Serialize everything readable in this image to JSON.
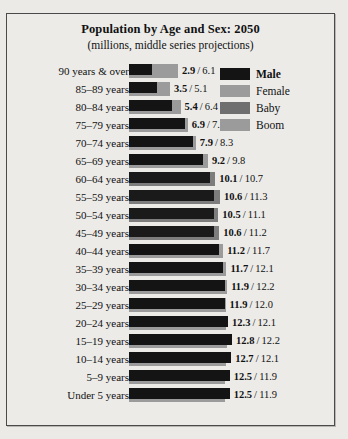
{
  "chart_data": {
    "type": "bar",
    "title": "Population by Age and Sex: 2050",
    "subtitle": "(millions, middle series projections)",
    "xlabel": "",
    "ylabel": "",
    "grid": false,
    "legend_position": "right",
    "xmax": 13.6,
    "categories": [
      "90 years & over",
      "85–89 years",
      "80–84 years",
      "75–79 years",
      "70–74 years",
      "65–69 years",
      "60–64 years",
      "55–59 years",
      "50–54 years",
      "45–49 years",
      "40–44 years",
      "35–39 years",
      "30–34 years",
      "25–29 years",
      "20–24 years",
      "15–19 years",
      "10–14 years",
      "5–9 years",
      "Under 5 years"
    ],
    "series": [
      {
        "name": "Male",
        "color": "#141414",
        "values": [
          2.9,
          3.5,
          5.4,
          6.9,
          7.9,
          9.2,
          10.1,
          10.6,
          10.5,
          10.6,
          11.2,
          11.7,
          11.9,
          11.9,
          12.3,
          12.8,
          12.7,
          12.5,
          12.5
        ]
      },
      {
        "name": "Female",
        "color": "#9b9b9b",
        "values": [
          6.1,
          5.1,
          6.4,
          7.3,
          8.3,
          9.8,
          10.7,
          11.3,
          11.1,
          11.2,
          11.7,
          12.1,
          12.2,
          12.0,
          12.1,
          12.2,
          12.1,
          11.9,
          11.9
        ]
      }
    ],
    "baby_boom_categories": [
      "60–64 years",
      "55–59 years",
      "50–54 years",
      "45–49 years"
    ],
    "value_labels": [
      {
        "male": "2.9",
        "sep": "/",
        "female": "6.1"
      },
      {
        "male": "3.5",
        "sep": "/",
        "female": "5.1"
      },
      {
        "male": "5.4",
        "sep": "/",
        "female": "6.4"
      },
      {
        "male": "6.9",
        "sep": "/",
        "female": "7.3"
      },
      {
        "male": "7.9",
        "sep": "/",
        "female": "8.3"
      },
      {
        "male": "9.2",
        "sep": "/",
        "female": "9.8"
      },
      {
        "male": "10.1",
        "sep": "/",
        "female": "10.7"
      },
      {
        "male": "10.6",
        "sep": "/",
        "female": "11.3"
      },
      {
        "male": "10.5",
        "sep": "/",
        "female": "11.1"
      },
      {
        "male": "10.6",
        "sep": "/",
        "female": "11.2"
      },
      {
        "male": "11.2",
        "sep": "/",
        "female": "11.7"
      },
      {
        "male": "11.7",
        "sep": "/",
        "female": "12.1"
      },
      {
        "male": "11.9",
        "sep": "/",
        "female": "12.2"
      },
      {
        "male": "11.9",
        "sep": "/",
        "female": "12.0"
      },
      {
        "male": "12.3",
        "sep": "/",
        "female": "12.1"
      },
      {
        "male": "12.8",
        "sep": "/",
        "female": "12.2"
      },
      {
        "male": "12.7",
        "sep": "/",
        "female": "12.1"
      },
      {
        "male": "12.5",
        "sep": "/",
        "female": "11.9"
      },
      {
        "male": "12.5",
        "sep": "/",
        "female": "11.9"
      }
    ]
  },
  "legend": {
    "items": [
      {
        "label": "Male",
        "swatch": "male-swatch",
        "bold": true
      },
      {
        "label": "Female",
        "swatch": "female-swatch",
        "bold": false
      },
      {
        "label": "Baby",
        "swatch": "baby-swatch",
        "bold": false
      },
      {
        "label": "Boom",
        "swatch": "boom-swatch",
        "bold": false
      }
    ]
  },
  "colors": {
    "male": "#141414",
    "female": "#9b9b9b",
    "baby_boom": "#6f6f6f",
    "panel_background": "#ecebe8",
    "border": "#4a4a4a"
  }
}
